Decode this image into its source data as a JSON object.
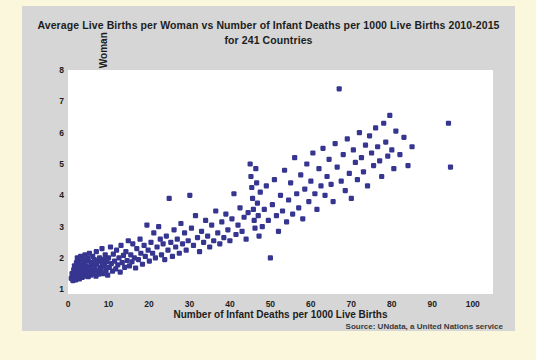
{
  "chart_data": {
    "type": "scatter",
    "title": "Average Live Births per Woman vs Number of Infant Deaths per 1000 Live Births 2010-2015 for 241 Countries",
    "title_line1": "Average Live Births per Woman vs Number of Infant Deaths per 1000 Live Births 2010-2015",
    "title_line2": "for 241 Countries",
    "xlabel": "Number of Infant Deaths per 1000 Live Births",
    "ylabel": "Average Live Births per Woman",
    "source": "Source: UNdata, a United Nations service",
    "xlim": [
      0,
      105
    ],
    "ylim": [
      0.85,
      8
    ],
    "xticks": [
      0,
      10,
      20,
      30,
      40,
      50,
      60,
      70,
      80,
      90,
      100
    ],
    "yticks": [
      1,
      2,
      3,
      4,
      5,
      6,
      7,
      8
    ],
    "grid": false,
    "legend": false,
    "marker_color": "#363691",
    "marker_size": 4,
    "n_points": 241,
    "points": [
      [
        0.8,
        1.35
      ],
      [
        1.0,
        1.5
      ],
      [
        1.2,
        1.28
      ],
      [
        1.4,
        1.62
      ],
      [
        1.5,
        1.42
      ],
      [
        1.6,
        1.75
      ],
      [
        1.8,
        1.55
      ],
      [
        1.9,
        1.3
      ],
      [
        2.0,
        1.45
      ],
      [
        2.1,
        1.85
      ],
      [
        2.2,
        1.6
      ],
      [
        2.3,
        2.0
      ],
      [
        2.4,
        1.4
      ],
      [
        2.5,
        1.72
      ],
      [
        2.6,
        1.5
      ],
      [
        2.7,
        1.9
      ],
      [
        2.8,
        1.33
      ],
      [
        2.9,
        1.68
      ],
      [
        3.0,
        1.55
      ],
      [
        3.1,
        2.05
      ],
      [
        3.2,
        1.45
      ],
      [
        3.3,
        1.78
      ],
      [
        3.4,
        1.6
      ],
      [
        3.5,
        1.38
      ],
      [
        3.6,
        1.95
      ],
      [
        3.7,
        1.52
      ],
      [
        3.8,
        1.7
      ],
      [
        3.9,
        1.42
      ],
      [
        4.0,
        1.86
      ],
      [
        4.1,
        1.6
      ],
      [
        4.2,
        2.1
      ],
      [
        4.3,
        1.48
      ],
      [
        4.5,
        1.74
      ],
      [
        4.6,
        1.55
      ],
      [
        4.8,
        2.0
      ],
      [
        4.9,
        1.65
      ],
      [
        5.0,
        1.4
      ],
      [
        5.1,
        1.9
      ],
      [
        5.2,
        1.58
      ],
      [
        5.3,
        2.15
      ],
      [
        5.5,
        1.7
      ],
      [
        5.6,
        1.45
      ],
      [
        5.8,
        1.85
      ],
      [
        6.0,
        1.6
      ],
      [
        6.1,
        2.05
      ],
      [
        6.2,
        1.5
      ],
      [
        6.4,
        1.78
      ],
      [
        6.5,
        1.95
      ],
      [
        6.7,
        1.65
      ],
      [
        6.9,
        1.42
      ],
      [
        7.0,
        2.2
      ],
      [
        7.1,
        1.8
      ],
      [
        7.3,
        1.58
      ],
      [
        7.5,
        1.9
      ],
      [
        7.6,
        1.48
      ],
      [
        7.8,
        2.0
      ],
      [
        8.0,
        1.7
      ],
      [
        8.2,
        1.62
      ],
      [
        8.4,
        2.3
      ],
      [
        8.5,
        1.85
      ],
      [
        8.7,
        1.5
      ],
      [
        8.9,
        1.95
      ],
      [
        9.0,
        1.75
      ],
      [
        9.2,
        2.1
      ],
      [
        9.4,
        1.6
      ],
      [
        9.6,
        1.88
      ],
      [
        9.8,
        1.45
      ],
      [
        10.0,
        2.0
      ],
      [
        10.2,
        1.7
      ],
      [
        10.5,
        2.35
      ],
      [
        10.7,
        1.82
      ],
      [
        11.0,
        1.58
      ],
      [
        11.2,
        2.12
      ],
      [
        11.5,
        1.9
      ],
      [
        11.8,
        1.65
      ],
      [
        12.0,
        2.25
      ],
      [
        12.3,
        1.78
      ],
      [
        12.6,
        2.0
      ],
      [
        12.9,
        1.55
      ],
      [
        13.1,
        2.4
      ],
      [
        13.4,
        1.85
      ],
      [
        13.7,
        2.08
      ],
      [
        14.0,
        1.7
      ],
      [
        14.3,
        2.2
      ],
      [
        14.6,
        1.92
      ],
      [
        14.9,
        2.55
      ],
      [
        15.2,
        1.75
      ],
      [
        15.5,
        2.1
      ],
      [
        15.8,
        1.88
      ],
      [
        16.0,
        2.45
      ],
      [
        16.4,
        2.0
      ],
      [
        16.7,
        1.68
      ],
      [
        17.0,
        2.3
      ],
      [
        17.4,
        1.95
      ],
      [
        17.8,
        2.6
      ],
      [
        18.0,
        2.15
      ],
      [
        18.4,
        1.8
      ],
      [
        18.8,
        2.4
      ],
      [
        19.1,
        2.05
      ],
      [
        19.5,
        3.05
      ],
      [
        19.8,
        2.25
      ],
      [
        20.1,
        1.9
      ],
      [
        20.5,
        2.5
      ],
      [
        20.9,
        2.15
      ],
      [
        21.2,
        2.8
      ],
      [
        21.6,
        2.0
      ],
      [
        22.0,
        2.35
      ],
      [
        22.4,
        3.0
      ],
      [
        22.8,
        2.6
      ],
      [
        23.1,
        2.1
      ],
      [
        23.5,
        2.45
      ],
      [
        23.9,
        1.95
      ],
      [
        24.3,
        2.7
      ],
      [
        24.7,
        2.25
      ],
      [
        25.0,
        3.9
      ],
      [
        25.4,
        2.5
      ],
      [
        25.8,
        2.05
      ],
      [
        26.2,
        2.9
      ],
      [
        26.6,
        2.35
      ],
      [
        27.0,
        2.6
      ],
      [
        27.5,
        2.15
      ],
      [
        27.9,
        3.1
      ],
      [
        28.3,
        2.45
      ],
      [
        28.8,
        2.8
      ],
      [
        29.2,
        2.25
      ],
      [
        29.7,
        2.55
      ],
      [
        30.1,
        4.0
      ],
      [
        30.5,
        2.95
      ],
      [
        31.0,
        2.4
      ],
      [
        31.5,
        3.35
      ],
      [
        32.0,
        2.65
      ],
      [
        32.5,
        2.2
      ],
      [
        33.0,
        2.85
      ],
      [
        33.5,
        2.5
      ],
      [
        34.0,
        3.2
      ],
      [
        34.5,
        2.7
      ],
      [
        35.0,
        2.35
      ],
      [
        35.5,
        3.05
      ],
      [
        36.0,
        2.55
      ],
      [
        36.5,
        3.5
      ],
      [
        37.0,
        2.8
      ],
      [
        37.5,
        2.45
      ],
      [
        38.0,
        3.15
      ],
      [
        38.5,
        2.65
      ],
      [
        39.0,
        3.4
      ],
      [
        39.5,
        2.9
      ],
      [
        40.0,
        2.55
      ],
      [
        40.5,
        3.25
      ],
      [
        41.0,
        4.05
      ],
      [
        41.5,
        2.75
      ],
      [
        42.0,
        3.05
      ],
      [
        42.5,
        3.6
      ],
      [
        43.0,
        2.85
      ],
      [
        43.5,
        3.3
      ],
      [
        44.0,
        2.6
      ],
      [
        44.5,
        3.45
      ],
      [
        45.0,
        5.0
      ],
      [
        45.2,
        4.6
      ],
      [
        45.4,
        4.25
      ],
      [
        45.6,
        3.9
      ],
      [
        45.8,
        3.55
      ],
      [
        46.0,
        3.2
      ],
      [
        46.2,
        2.95
      ],
      [
        46.4,
        4.85
      ],
      [
        46.6,
        4.4
      ],
      [
        46.8,
        3.75
      ],
      [
        47.0,
        3.35
      ],
      [
        47.2,
        2.7
      ],
      [
        47.5,
        4.1
      ],
      [
        48.0,
        3.0
      ],
      [
        48.5,
        3.55
      ],
      [
        49.0,
        4.3
      ],
      [
        49.5,
        3.2
      ],
      [
        50.0,
        2.0
      ],
      [
        50.5,
        3.7
      ],
      [
        51.0,
        4.5
      ],
      [
        51.5,
        3.35
      ],
      [
        52.0,
        2.85
      ],
      [
        52.5,
        4.0
      ],
      [
        53.0,
        3.5
      ],
      [
        53.5,
        4.8
      ],
      [
        54.0,
        3.15
      ],
      [
        54.5,
        3.85
      ],
      [
        55.0,
        4.4
      ],
      [
        55.5,
        3.4
      ],
      [
        56.0,
        5.2
      ],
      [
        56.5,
        4.05
      ],
      [
        57.0,
        3.6
      ],
      [
        57.5,
        4.65
      ],
      [
        58.0,
        3.25
      ],
      [
        58.5,
        4.2
      ],
      [
        59.0,
        5.0
      ],
      [
        59.5,
        3.8
      ],
      [
        60.0,
        4.45
      ],
      [
        60.5,
        5.35
      ],
      [
        61.0,
        4.05
      ],
      [
        61.5,
        3.55
      ],
      [
        62.0,
        4.85
      ],
      [
        62.5,
        4.3
      ],
      [
        63.0,
        5.5
      ],
      [
        63.5,
        4.0
      ],
      [
        64.0,
        4.6
      ],
      [
        64.5,
        5.15
      ],
      [
        65.0,
        4.35
      ],
      [
        65.5,
        3.8
      ],
      [
        66.0,
        5.65
      ],
      [
        66.5,
        4.9
      ],
      [
        67.0,
        7.4
      ],
      [
        67.5,
        4.45
      ],
      [
        68.0,
        5.3
      ],
      [
        68.5,
        4.15
      ],
      [
        69.0,
        5.8
      ],
      [
        69.5,
        4.7
      ],
      [
        70.0,
        3.9
      ],
      [
        70.5,
        5.45
      ],
      [
        71.0,
        5.05
      ],
      [
        71.5,
        4.5
      ],
      [
        72.0,
        6.0
      ],
      [
        72.5,
        5.2
      ],
      [
        73.0,
        4.75
      ],
      [
        73.5,
        5.6
      ],
      [
        74.0,
        4.3
      ],
      [
        74.5,
        5.9
      ],
      [
        75.0,
        5.35
      ],
      [
        75.5,
        4.95
      ],
      [
        76.0,
        6.15
      ],
      [
        76.5,
        5.55
      ],
      [
        77.0,
        5.1
      ],
      [
        77.5,
        4.6
      ],
      [
        78.0,
        6.3
      ],
      [
        78.5,
        5.7
      ],
      [
        79.0,
        5.25
      ],
      [
        79.5,
        6.55
      ],
      [
        80.0,
        5.45
      ],
      [
        80.5,
        4.85
      ],
      [
        81.0,
        6.05
      ],
      [
        82.0,
        5.3
      ],
      [
        83.0,
        5.85
      ],
      [
        84.0,
        4.95
      ],
      [
        85.0,
        5.55
      ],
      [
        94.0,
        6.3
      ],
      [
        94.5,
        4.9
      ]
    ]
  }
}
